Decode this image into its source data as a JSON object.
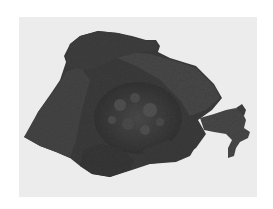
{
  "image": {
    "subject": "gross-specimen",
    "description": "Grayscale photograph of a dark tissue specimen with a nodular central mass partially enclosed by smooth flap-like lobes, on a light gray background",
    "colors": {
      "border": "#ffffff",
      "background": "#ececec",
      "specimen_dark": "#353535",
      "specimen_mid": "#474747",
      "specimen_light": "#5a5a5a"
    }
  }
}
